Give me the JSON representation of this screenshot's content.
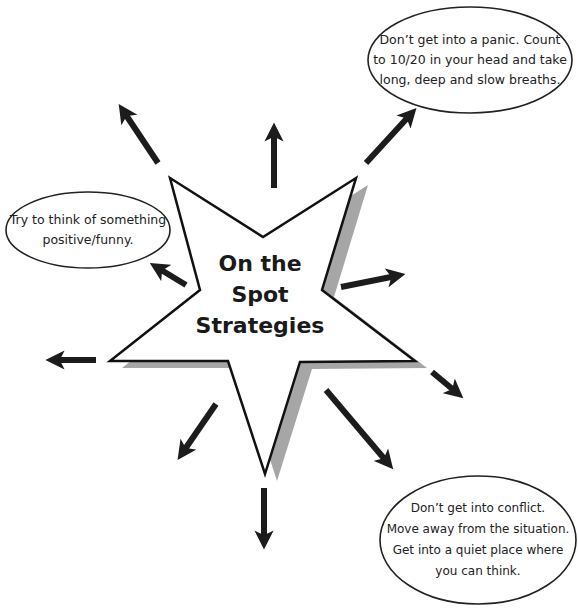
{
  "diagram": {
    "center_title": [
      "On the",
      "Spot",
      "Strategies"
    ],
    "bubbles": [
      {
        "id": "panic",
        "lines": [
          "Don’t get into a panic. Count",
          "to 10/20 in your head and take",
          "long, deep and slow breaths."
        ]
      },
      {
        "id": "positive",
        "lines": [
          "Try to think of something",
          "positive/funny."
        ]
      },
      {
        "id": "conflict",
        "lines": [
          "Don’t get into conflict.",
          "Move away from the situation.",
          "Get into a quiet place where",
          "you can think."
        ]
      }
    ],
    "arrow_count": 10,
    "colors": {
      "star_fill": "#ffffff",
      "star_stroke": "#111111",
      "shadow": "#a6a6a6",
      "arrow": "#1c1c1c"
    }
  }
}
